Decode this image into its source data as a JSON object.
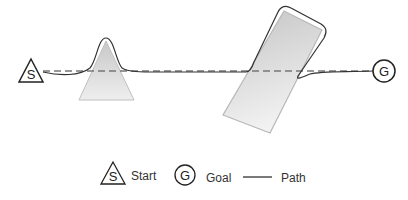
{
  "diagram": {
    "start": {
      "label": "S",
      "center": [
        31,
        72
      ]
    },
    "goal": {
      "label": "G",
      "center": [
        384,
        71
      ]
    },
    "obstacles": [
      {
        "type": "triangle",
        "apex": [
          106,
          41
        ],
        "base": [
          [
            79,
            100
          ],
          [
            134,
            100
          ]
        ]
      },
      {
        "type": "rotated-rectangle",
        "corners": [
          [
            284,
            11
          ],
          [
            322,
            30
          ],
          [
            270,
            133
          ],
          [
            223,
            115
          ]
        ]
      }
    ],
    "straight_line_style": "dashed",
    "path_style": "solid",
    "colors": {
      "stroke": "#333333",
      "dashed": "#777777",
      "obstacle_fill_top": "#d0d0d0",
      "obstacle_fill_bottom": "#f0f0f0",
      "obstacle_stroke": "#bbbbbb"
    }
  },
  "legend": {
    "start_symbol": "S",
    "start_label": "Start",
    "goal_symbol": "G",
    "goal_label": "Goal",
    "path_label": "Path"
  }
}
